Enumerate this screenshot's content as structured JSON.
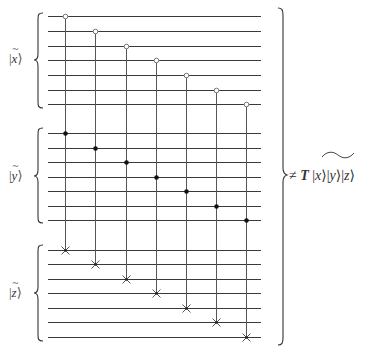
{
  "diagram": {
    "type": "quantum-circuit",
    "registers": [
      {
        "name": "x",
        "label": "x",
        "tilde": true,
        "wires_y": [
          16,
          31,
          46,
          60,
          75,
          90,
          104
        ]
      },
      {
        "name": "y",
        "label": "y",
        "tilde": true,
        "wires_y": [
          133,
          148,
          162,
          177,
          191,
          206,
          220
        ]
      },
      {
        "name": "z",
        "label": "z",
        "tilde": true,
        "wires_y": [
          250,
          264,
          279,
          293,
          308,
          322,
          337
        ]
      }
    ],
    "wire_x_start": 48,
    "wire_x_end": 261,
    "gates": [
      {
        "x": 65,
        "open_control_y": 16,
        "filled_control_y": 133,
        "target_y": 250
      },
      {
        "x": 95,
        "open_control_y": 31,
        "filled_control_y": 148,
        "target_y": 264
      },
      {
        "x": 126,
        "open_control_y": 46,
        "filled_control_y": 162,
        "target_y": 279
      },
      {
        "x": 156,
        "open_control_y": 60,
        "filled_control_y": 177,
        "target_y": 293
      },
      {
        "x": 186,
        "open_control_y": 75,
        "filled_control_y": 191,
        "target_y": 308
      },
      {
        "x": 216,
        "open_control_y": 90,
        "filled_control_y": 206,
        "target_y": 322
      },
      {
        "x": 246,
        "open_control_y": 104,
        "filled_control_y": 220,
        "target_y": 337
      }
    ],
    "left_labels": [
      {
        "text": "x",
        "bar": "|",
        "ket": "⟩",
        "tilde": "~"
      },
      {
        "text": "y",
        "bar": "|",
        "ket": "⟩",
        "tilde": "~"
      },
      {
        "text": "z",
        "bar": "|",
        "ket": "⟩",
        "tilde": "~"
      }
    ],
    "equation": {
      "relation": "≠",
      "operator": "T",
      "kets": [
        {
          "bar": "|",
          "var": "x",
          "ket": "⟩"
        },
        {
          "bar": "|",
          "var": "y",
          "ket": "⟩"
        },
        {
          "bar": "|",
          "var": "z",
          "ket": "⟩"
        }
      ],
      "wide_tilde_over": "x⟩|y"
    },
    "colors": {
      "wire": "#3a3a3a",
      "vertical": "#555555",
      "filled_control": "#111111",
      "open_control_stroke": "#777777",
      "background": "#ffffff"
    }
  }
}
